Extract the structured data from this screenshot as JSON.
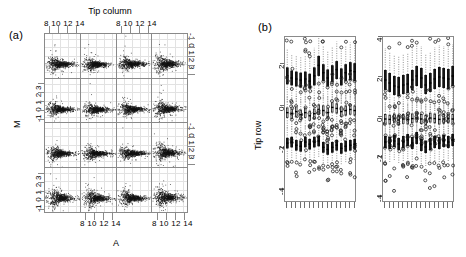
{
  "figure": {
    "panel_a_tag": "(a)",
    "panel_b_tag": "(b)"
  },
  "panel_a": {
    "strip_title": "Tip column",
    "x_axis_label": "A",
    "y_axis_label": "M",
    "x_tick_labels": "8  10 12 14",
    "x_ticks": [
      8,
      10,
      12,
      14
    ],
    "y_tick_labels": "-1 0 1 2 3",
    "y_ticks": [
      -1,
      0,
      1,
      2,
      3
    ],
    "rows": 4,
    "cols": 4
  },
  "panel_b": {
    "y_axis_label": "Tip row",
    "left_y_tick_labels": [
      "2",
      "0",
      "-2",
      "-4"
    ],
    "left_y_ticks": [
      2,
      0,
      -2,
      -4
    ],
    "right_y_tick_labels": [
      "4",
      "2",
      "0",
      "-2",
      "-4"
    ],
    "right_y_ticks": [
      4,
      2,
      0,
      -2,
      -4
    ],
    "group_count": 16
  },
  "chart_data": [
    {
      "type": "scatter",
      "title": "Tip column",
      "xlabel": "A",
      "ylabel": "M",
      "xlim": [
        6.2,
        15.4
      ],
      "ylim": [
        -1.8,
        3.6
      ],
      "xticks": [
        8,
        10,
        12,
        14
      ],
      "yticks": [
        -1,
        0,
        1,
        2,
        3
      ],
      "grid": true,
      "facets": {
        "rows": 4,
        "cols": 4,
        "layout": "4x4 conditioned on Tip column (x) and Tip row (y)",
        "panel_point_counts": [
          [
            640,
            640,
            640,
            640
          ],
          [
            640,
            640,
            640,
            640
          ],
          [
            640,
            640,
            640,
            640
          ],
          [
            640,
            640,
            640,
            640
          ]
        ],
        "panel_m_center": [
          [
            0.02,
            -0.02,
            0.04,
            0.06
          ],
          [
            0.0,
            -0.03,
            0.01,
            0.05
          ],
          [
            -0.01,
            -0.04,
            0.0,
            0.07
          ],
          [
            0.05,
            0.02,
            0.03,
            0.1
          ]
        ],
        "panel_m_spread": [
          [
            0.34,
            0.3,
            0.32,
            0.36
          ],
          [
            0.31,
            0.3,
            0.29,
            0.35
          ],
          [
            0.33,
            0.31,
            0.28,
            0.4
          ],
          [
            0.42,
            0.4,
            0.38,
            0.44
          ]
        ],
        "a_mode": 9.6,
        "a_spread": 1.45
      }
    },
    {
      "type": "boxplot",
      "name": "left-boxplot",
      "ylabel": "Tip row",
      "ylim": [
        -4.6,
        3.3
      ],
      "yticks": [
        2,
        0,
        -2,
        -4
      ],
      "grid": false,
      "groups": [
        "1",
        "2",
        "3",
        "4",
        "5",
        "6",
        "7",
        "8",
        "9",
        "10",
        "11",
        "12",
        "13",
        "14",
        "15",
        "16"
      ],
      "series": [
        {
          "name": "upper-cluster",
          "medians": [
            1.45,
            1.35,
            1.3,
            1.25,
            1.3,
            1.2,
            1.45,
            1.95,
            1.6,
            1.35,
            1.55,
            1.75,
            1.4,
            1.6,
            1.7,
            1.65
          ],
          "q1": [
            1.05,
            1.0,
            0.95,
            0.9,
            0.95,
            0.85,
            1.0,
            1.45,
            1.2,
            0.95,
            1.15,
            1.3,
            1.0,
            1.2,
            1.25,
            1.2
          ],
          "q3": [
            1.85,
            1.7,
            1.65,
            1.6,
            1.65,
            1.55,
            1.85,
            2.4,
            2.0,
            1.75,
            1.95,
            2.15,
            1.8,
            2.0,
            2.1,
            2.05
          ]
        },
        {
          "name": "middle-cluster",
          "medians": [
            -0.3,
            -0.35,
            -0.25,
            -0.4,
            -0.3,
            -0.45,
            -0.35,
            -0.15,
            -0.2,
            -0.3,
            -0.05,
            -0.1,
            -0.25,
            -0.2,
            -0.15,
            -0.2
          ],
          "q1": [
            -0.55,
            -0.6,
            -0.5,
            -0.65,
            -0.55,
            -0.7,
            -0.6,
            -0.4,
            -0.45,
            -0.55,
            -0.3,
            -0.35,
            -0.5,
            -0.45,
            -0.4,
            -0.45
          ],
          "q3": [
            -0.05,
            -0.1,
            0.0,
            -0.15,
            -0.05,
            -0.2,
            -0.1,
            0.1,
            0.05,
            -0.05,
            0.2,
            0.15,
            0.0,
            0.05,
            0.1,
            0.05
          ]
        },
        {
          "name": "lower-cluster",
          "medians": [
            -1.75,
            -1.7,
            -1.85,
            -1.9,
            -1.7,
            -1.8,
            -1.7,
            -1.65,
            -1.95,
            -2.05,
            -1.95,
            -1.85,
            -2.0,
            -1.9,
            -1.85,
            -1.8
          ],
          "q1": [
            -2.0,
            -1.95,
            -2.1,
            -2.15,
            -1.95,
            -2.05,
            -1.95,
            -1.9,
            -2.2,
            -2.3,
            -2.2,
            -2.1,
            -2.25,
            -2.15,
            -2.1,
            -2.05
          ],
          "q3": [
            -1.5,
            -1.45,
            -1.6,
            -1.65,
            -1.45,
            -1.55,
            -1.45,
            -1.4,
            -1.7,
            -1.8,
            -1.7,
            -1.6,
            -1.75,
            -1.65,
            -1.6,
            -1.55
          ]
        }
      ]
    },
    {
      "type": "boxplot",
      "name": "right-boxplot",
      "ylabel": "Tip row",
      "ylim": [
        -4.3,
        4.0
      ],
      "yticks": [
        4,
        2,
        0,
        -2,
        -4
      ],
      "grid": false,
      "groups": [
        "1",
        "2",
        "3",
        "4",
        "5",
        "6",
        "7",
        "8",
        "9",
        "10",
        "11",
        "12",
        "13",
        "14",
        "15",
        "16"
      ],
      "series": [
        {
          "name": "upper-cluster",
          "medians": [
            1.85,
            1.7,
            1.55,
            1.5,
            1.6,
            1.65,
            1.85,
            2.05,
            1.95,
            1.6,
            1.7,
            1.9,
            2.0,
            1.95,
            1.9,
            2.05
          ],
          "q1": [
            1.35,
            1.25,
            1.1,
            1.05,
            1.15,
            1.2,
            1.35,
            1.55,
            1.45,
            1.15,
            1.25,
            1.4,
            1.5,
            1.45,
            1.4,
            1.55
          ],
          "q3": [
            2.35,
            2.2,
            2.05,
            2.0,
            2.1,
            2.15,
            2.35,
            2.55,
            2.45,
            2.1,
            2.2,
            2.4,
            2.5,
            2.45,
            2.4,
            2.55
          ]
        },
        {
          "name": "middle-cluster",
          "medians": [
            -0.1,
            -0.12,
            -0.08,
            -0.15,
            -0.1,
            -0.12,
            -0.08,
            -0.05,
            -0.1,
            -0.15,
            -0.05,
            -0.08,
            -0.12,
            -0.1,
            -0.08,
            -0.1
          ],
          "q1": [
            -0.35,
            -0.38,
            -0.32,
            -0.42,
            -0.35,
            -0.38,
            -0.32,
            -0.28,
            -0.35,
            -0.42,
            -0.28,
            -0.32,
            -0.38,
            -0.35,
            -0.32,
            -0.35
          ],
          "q3": [
            0.15,
            0.12,
            0.18,
            0.1,
            0.15,
            0.12,
            0.18,
            0.22,
            0.15,
            0.1,
            0.22,
            0.18,
            0.12,
            0.15,
            0.18,
            0.15
          ]
        },
        {
          "name": "lower-cluster",
          "medians": [
            -1.25,
            -1.3,
            -1.2,
            -1.35,
            -1.25,
            -1.15,
            -1.3,
            -1.05,
            -1.4,
            -1.5,
            -1.35,
            -1.25,
            -1.3,
            -1.2,
            -1.25,
            -1.15
          ],
          "q1": [
            -1.55,
            -1.6,
            -1.5,
            -1.65,
            -1.55,
            -1.45,
            -1.6,
            -1.35,
            -1.7,
            -1.8,
            -1.65,
            -1.55,
            -1.6,
            -1.5,
            -1.55,
            -1.45
          ],
          "q3": [
            -0.95,
            -1.0,
            -0.9,
            -1.05,
            -0.95,
            -0.85,
            -1.0,
            -0.75,
            -1.1,
            -1.2,
            -1.05,
            -0.95,
            -1.0,
            -0.9,
            -0.95,
            -0.85
          ]
        }
      ]
    }
  ]
}
